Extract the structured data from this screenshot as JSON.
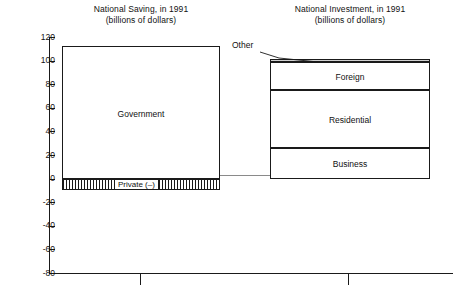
{
  "chart_data": {
    "type": "bar",
    "xlabel": "",
    "ylabel": "",
    "ylim": [
      -80,
      120
    ],
    "ytick_step": 20,
    "yticks": [
      120,
      100,
      80,
      60,
      40,
      20,
      0,
      -20,
      -40,
      -60,
      -80
    ],
    "ytick_labels": [
      "120",
      "100",
      "80",
      "60",
      "40",
      "20",
      "0",
      "-20",
      "-40",
      "-60",
      "-80"
    ],
    "grid": false,
    "legend": "none",
    "units": "billions of dollars",
    "year": 1991,
    "categories": [
      "National Saving",
      "National Investment"
    ],
    "panels": [
      {
        "title": "National Saving, in 1991",
        "subtitle": "(billions of dollars)",
        "total": 102,
        "segments": [
          {
            "name": "Government",
            "label": "Government",
            "from": 0,
            "to": 112,
            "value": 112,
            "fill": "white",
            "pattern": "none"
          },
          {
            "name": "Private",
            "label": "Private (–)",
            "from": 0,
            "to": -10,
            "value": -10,
            "fill": "white",
            "pattern": "vertical-hatch"
          }
        ]
      },
      {
        "title": "National Investment, in 1991",
        "subtitle": "(billions of dollars)",
        "total": 101,
        "segments": [
          {
            "name": "Business",
            "label": "Business",
            "from": 0,
            "to": 26,
            "value": 26,
            "fill": "white",
            "pattern": "none"
          },
          {
            "name": "Residential",
            "label": "Residential",
            "from": 26,
            "to": 75,
            "value": 49,
            "fill": "white",
            "pattern": "none"
          },
          {
            "name": "Foreign",
            "label": "Foreign",
            "from": 75,
            "to": 99,
            "value": 24,
            "fill": "white",
            "pattern": "none"
          },
          {
            "name": "Other",
            "label": "Other",
            "from": 99,
            "to": 101,
            "value": 2,
            "fill": "gray",
            "pattern": "none",
            "callout": true
          }
        ]
      }
    ],
    "annotations": [
      {
        "name": "other-callout",
        "text": "Other",
        "points_to": "Other segment at top of National Investment bar"
      }
    ]
  },
  "colors": {
    "ink": "#1a1a1a",
    "sliver_fill": "#cfcfcf",
    "connector": "#8a8a8a",
    "background": "#ffffff"
  }
}
